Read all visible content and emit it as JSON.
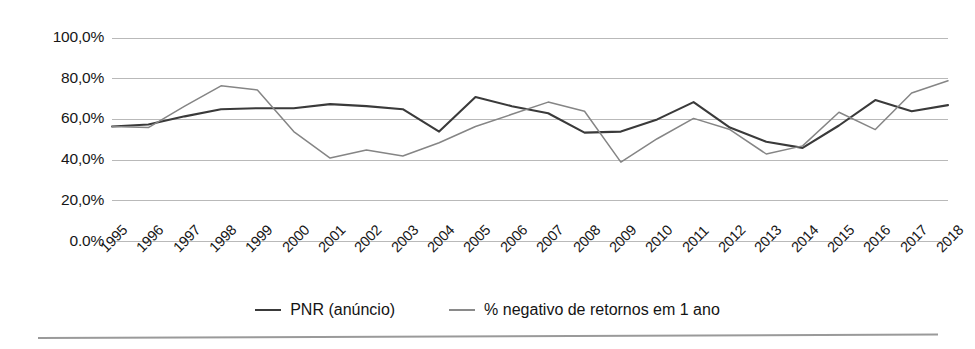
{
  "chart_data": {
    "type": "line",
    "title": "",
    "xlabel": "",
    "ylabel": "",
    "ylim": [
      0,
      100
    ],
    "yticks": [
      0,
      20,
      40,
      60,
      80,
      100
    ],
    "ytick_labels": [
      "0.0%",
      "20,0%",
      "40,0%",
      "60,0%",
      "80,0%",
      "100,0%"
    ],
    "grid": true,
    "legend_position": "bottom",
    "categories": [
      "1995",
      "1996",
      "1997",
      "1998",
      "1999",
      "2000",
      "2001",
      "2002",
      "2003",
      "2004",
      "2005",
      "2006",
      "2007",
      "2008",
      "2009",
      "2010",
      "2011",
      "2012",
      "2013",
      "2014",
      "2015",
      "2016",
      "2017",
      "2018"
    ],
    "series": [
      {
        "name": "PNR (anúncio)",
        "color": "#3a3a3a",
        "values": [
          56.5,
          57.5,
          61.5,
          65.0,
          65.5,
          65.5,
          67.5,
          66.5,
          65.0,
          54.0,
          71.0,
          66.5,
          63.0,
          53.5,
          54.0,
          60.0,
          68.5,
          56.0,
          49.0,
          46.0,
          57.0,
          69.5,
          64.0,
          67.0
        ]
      },
      {
        "name": "% negativo de retornos em 1 ano",
        "color": "#858585",
        "values": [
          56.5,
          56.0,
          66.5,
          76.5,
          74.5,
          54.0,
          41.0,
          45.0,
          42.0,
          48.5,
          56.5,
          62.5,
          68.5,
          64.0,
          39.0,
          50.5,
          60.5,
          55.0,
          43.0,
          47.0,
          63.5,
          55.0,
          73.0,
          79.0
        ]
      }
    ]
  },
  "legend": {
    "entries": [
      {
        "label": "PNR (anúncio)",
        "color": "#3a3a3a"
      },
      {
        "label": "% negativo de retornos em 1 ano",
        "color": "#8a8a8a"
      }
    ]
  }
}
